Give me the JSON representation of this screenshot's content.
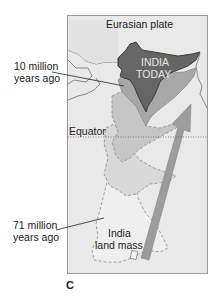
{
  "figure": {
    "panel_label": "C",
    "labels": {
      "plate": "Eurasian plate",
      "india_today_line1": "INDIA",
      "india_today_line2": "TODAY",
      "ten_my_line1": "10 million",
      "ten_my_line2": "years ago",
      "equator": "Equator",
      "seventy_one_my_line1": "71 million",
      "seventy_one_my_line2": "years ago",
      "landmass_line1": "India",
      "landmass_line2": "land mass"
    },
    "colors": {
      "background": "#e8e8e8",
      "frame": "#9a9a9a",
      "india_today": "#6b6b6b",
      "stage_10my": "#a6a6a6",
      "stage_mid": "#c4c4c4",
      "stage_lower": "#d6d6d6",
      "stage_71my": "#ececec",
      "arrow": "#9c9c9c",
      "coast": "#666666"
    }
  }
}
